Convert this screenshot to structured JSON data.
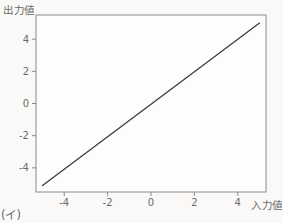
{
  "figure": {
    "caption": "(イ)"
  },
  "chart_data": {
    "type": "line",
    "title": "",
    "xlabel": "入力値",
    "ylabel": "出力値",
    "xlim": [
      -5.3,
      5.3
    ],
    "ylim": [
      -5.5,
      5.5
    ],
    "xticks": [
      -4,
      -2,
      0,
      2,
      4
    ],
    "yticks": [
      -4,
      -2,
      0,
      2,
      4
    ],
    "grid": false,
    "legend": false,
    "series": [
      {
        "name": "linear-response",
        "x": [
          -5,
          5
        ],
        "y": [
          -5.1,
          5.0
        ]
      }
    ]
  },
  "colors": {
    "background": "#faf9f7",
    "plot_background": "#fdfdfc",
    "frame": "#8a8a8a",
    "line": "#3d3d3d",
    "text": "#6a6a6a"
  }
}
